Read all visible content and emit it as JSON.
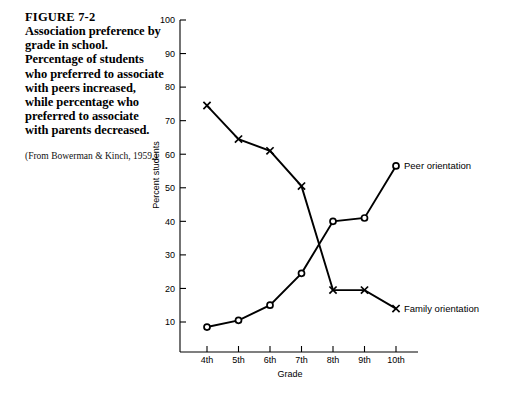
{
  "caption": {
    "figure_label": "FIGURE 7-2",
    "text": "Association preference by grade in school. Percentage of students who preferred to associate with peers increased, while percentage who preferred to associate with parents decreased.",
    "source": "(From Bowerman & Kinch, 1959.)"
  },
  "chart_data": {
    "type": "line",
    "title": "",
    "xlabel": "Grade",
    "ylabel": "Percent students",
    "categories": [
      "4th",
      "5th",
      "6th",
      "7th",
      "8th",
      "9th",
      "10th"
    ],
    "ylim": [
      0,
      100
    ],
    "yticks": [
      10,
      20,
      30,
      40,
      50,
      60,
      70,
      80,
      90,
      100
    ],
    "ytick_labels": [
      "10",
      "20",
      "30",
      "40",
      "50",
      "60",
      "70",
      "80",
      "90",
      "100"
    ],
    "grid": false,
    "legend_position": "inline-right",
    "series": [
      {
        "name": "Peer orientation",
        "marker": "open-circle",
        "values": [
          8.5,
          10.5,
          15,
          24.5,
          40,
          41,
          56.5
        ]
      },
      {
        "name": "Family orientation",
        "marker": "x",
        "values": [
          74.5,
          64.5,
          61,
          50.5,
          19.5,
          19.5,
          14
        ]
      }
    ],
    "annotations": [
      {
        "text": "Peer orientation",
        "series": "Peer orientation"
      },
      {
        "text": "Family orientation",
        "series": "Family orientation"
      }
    ]
  },
  "colors": {
    "ink": "#000000",
    "background": "#ffffff"
  }
}
